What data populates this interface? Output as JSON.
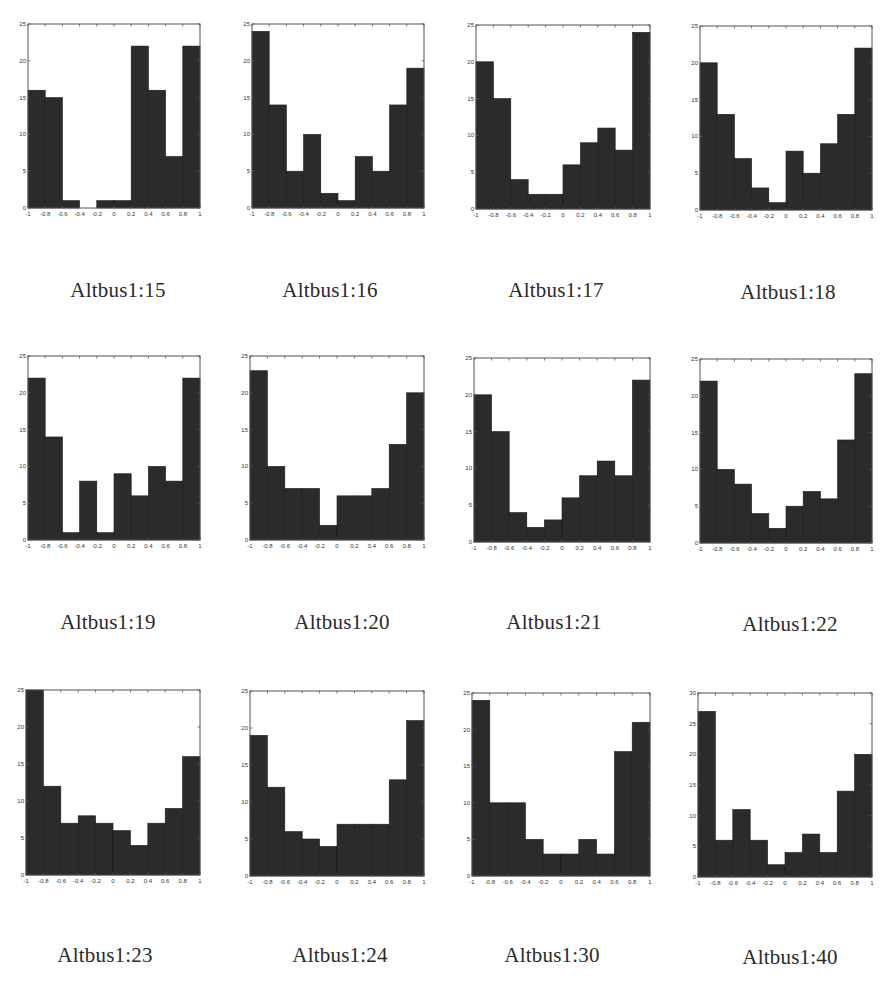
{
  "chart_data": [
    {
      "type": "bar",
      "title": "Altbus1:15",
      "xlabel": "",
      "ylabel": "",
      "xlim": [
        -1,
        1
      ],
      "ylim": [
        0,
        25
      ],
      "xticks": [
        "-1",
        "-0.8",
        "-0.6",
        "-0.4",
        "-0.2",
        "0",
        "0.2",
        "0.4",
        "0.6",
        "0.8",
        "1"
      ],
      "yticks": [
        "0",
        "5",
        "10",
        "15",
        "20",
        "25"
      ],
      "bin_edges": [
        -1,
        -0.8,
        -0.6,
        -0.4,
        -0.2,
        0,
        0.2,
        0.4,
        0.6,
        0.8,
        1
      ],
      "values": [
        16,
        15,
        1,
        0,
        1,
        1,
        22,
        16,
        7,
        22
      ],
      "grid": false
    },
    {
      "type": "bar",
      "title": "Altbus1:16",
      "xlabel": "",
      "ylabel": "",
      "xlim": [
        -1,
        1
      ],
      "ylim": [
        0,
        25
      ],
      "xticks": [
        "-1",
        "-0.8",
        "-0.6",
        "-0.4",
        "-0.2",
        "0",
        "0.2",
        "0.4",
        "0.6",
        "0.8",
        "1"
      ],
      "yticks": [
        "0",
        "5",
        "10",
        "15",
        "20",
        "25"
      ],
      "bin_edges": [
        -1,
        -0.8,
        -0.6,
        -0.4,
        -0.2,
        0,
        0.2,
        0.4,
        0.6,
        0.8,
        1
      ],
      "values": [
        24,
        14,
        5,
        10,
        2,
        1,
        7,
        5,
        14,
        19
      ],
      "grid": false
    },
    {
      "type": "bar",
      "title": "Altbus1:17",
      "xlabel": "",
      "ylabel": "",
      "xlim": [
        -1,
        1
      ],
      "ylim": [
        0,
        25
      ],
      "xticks": [
        "-1",
        "-0.8",
        "-0.6",
        "-0.4",
        "-0.2",
        "0",
        "0.2",
        "0.4",
        "0.6",
        "0.8",
        "1"
      ],
      "yticks": [
        "0",
        "5",
        "10",
        "15",
        "20",
        "25"
      ],
      "bin_edges": [
        -1,
        -0.8,
        -0.6,
        -0.4,
        -0.2,
        0,
        0.2,
        0.4,
        0.6,
        0.8,
        1
      ],
      "values": [
        20,
        15,
        4,
        2,
        2,
        6,
        9,
        11,
        8,
        24
      ],
      "grid": false
    },
    {
      "type": "bar",
      "title": "Altbus1:18",
      "xlabel": "",
      "ylabel": "",
      "xlim": [
        -1,
        1
      ],
      "ylim": [
        0,
        25
      ],
      "xticks": [
        "-1",
        "-0.8",
        "-0.6",
        "-0.4",
        "-0.2",
        "0",
        "0.2",
        "0.4",
        "0.6",
        "0.8",
        "1"
      ],
      "yticks": [
        "0",
        "5",
        "10",
        "15",
        "20",
        "25"
      ],
      "bin_edges": [
        -1,
        -0.8,
        -0.6,
        -0.4,
        -0.2,
        0,
        0.2,
        0.4,
        0.6,
        0.8,
        1
      ],
      "values": [
        20,
        13,
        7,
        3,
        1,
        8,
        5,
        9,
        13,
        22
      ],
      "grid": false
    },
    {
      "type": "bar",
      "title": "Altbus1:19",
      "xlabel": "",
      "ylabel": "",
      "xlim": [
        -1,
        1
      ],
      "ylim": [
        0,
        25
      ],
      "xticks": [
        "-1",
        "-0.8",
        "-0.6",
        "-0.4",
        "-0.2",
        "0",
        "0.2",
        "0.4",
        "0.6",
        "0.8",
        "1"
      ],
      "yticks": [
        "0",
        "5",
        "10",
        "15",
        "20",
        "25"
      ],
      "bin_edges": [
        -1,
        -0.8,
        -0.6,
        -0.4,
        -0.2,
        0,
        0.2,
        0.4,
        0.6,
        0.8,
        1
      ],
      "values": [
        22,
        14,
        1,
        8,
        1,
        9,
        6,
        10,
        8,
        22
      ],
      "grid": false
    },
    {
      "type": "bar",
      "title": "Altbus1:20",
      "xlabel": "",
      "ylabel": "",
      "xlim": [
        -1,
        1
      ],
      "ylim": [
        0,
        25
      ],
      "xticks": [
        "-1",
        "-0.8",
        "-0.6",
        "-0.4",
        "-0.2",
        "0",
        "0.2",
        "0.4",
        "0.6",
        "0.8",
        "1"
      ],
      "yticks": [
        "0",
        "5",
        "10",
        "15",
        "20",
        "25"
      ],
      "bin_edges": [
        -1,
        -0.8,
        -0.6,
        -0.4,
        -0.2,
        0,
        0.2,
        0.4,
        0.6,
        0.8,
        1
      ],
      "values": [
        23,
        10,
        7,
        7,
        2,
        6,
        6,
        7,
        13,
        20
      ],
      "grid": false
    },
    {
      "type": "bar",
      "title": "Altbus1:21",
      "xlabel": "",
      "ylabel": "",
      "xlim": [
        -1,
        1
      ],
      "ylim": [
        0,
        25
      ],
      "xticks": [
        "-1",
        "-0.8",
        "-0.6",
        "-0.4",
        "-0.2",
        "0",
        "0.2",
        "0.4",
        "0.6",
        "0.8",
        "1"
      ],
      "yticks": [
        "0",
        "5",
        "10",
        "15",
        "20",
        "25"
      ],
      "bin_edges": [
        -1,
        -0.8,
        -0.6,
        -0.4,
        -0.2,
        0,
        0.2,
        0.4,
        0.6,
        0.8,
        1
      ],
      "values": [
        20,
        15,
        4,
        2,
        3,
        6,
        9,
        11,
        9,
        22
      ],
      "grid": false
    },
    {
      "type": "bar",
      "title": "Altbus1:22",
      "xlabel": "",
      "ylabel": "",
      "xlim": [
        -1,
        1
      ],
      "ylim": [
        0,
        25
      ],
      "xticks": [
        "-1",
        "-0.8",
        "-0.6",
        "-0.4",
        "-0.2",
        "0",
        "0.2",
        "0.4",
        "0.6",
        "0.8",
        "1"
      ],
      "yticks": [
        "0",
        "5",
        "10",
        "15",
        "20",
        "25"
      ],
      "bin_edges": [
        -1,
        -0.8,
        -0.6,
        -0.4,
        -0.2,
        0,
        0.2,
        0.4,
        0.6,
        0.8,
        1
      ],
      "values": [
        22,
        10,
        8,
        4,
        2,
        5,
        7,
        6,
        14,
        23
      ],
      "grid": false
    },
    {
      "type": "bar",
      "title": "Altbus1:23",
      "xlabel": "",
      "ylabel": "",
      "xlim": [
        -1,
        1
      ],
      "ylim": [
        0,
        25
      ],
      "xticks": [
        "-1",
        "-0.8",
        "-0.6",
        "-0.4",
        "-0.2",
        "0",
        "0.2",
        "0.4",
        "0.6",
        "0.8",
        "1"
      ],
      "yticks": [
        "0",
        "5",
        "10",
        "15",
        "20",
        "25"
      ],
      "bin_edges": [
        -1,
        -0.8,
        -0.6,
        -0.4,
        -0.2,
        0,
        0.2,
        0.4,
        0.6,
        0.8,
        1
      ],
      "values": [
        25,
        12,
        7,
        8,
        7,
        6,
        4,
        7,
        9,
        16
      ],
      "grid": false
    },
    {
      "type": "bar",
      "title": "Altbus1:24",
      "xlabel": "",
      "ylabel": "",
      "xlim": [
        -1,
        1
      ],
      "ylim": [
        0,
        25
      ],
      "xticks": [
        "-1",
        "-0.8",
        "-0.6",
        "-0.4",
        "-0.2",
        "0",
        "0.2",
        "0.4",
        "0.6",
        "0.8",
        "1"
      ],
      "yticks": [
        "0",
        "5",
        "10",
        "15",
        "20",
        "25"
      ],
      "bin_edges": [
        -1,
        -0.8,
        -0.6,
        -0.4,
        -0.2,
        0,
        0.2,
        0.4,
        0.6,
        0.8,
        1
      ],
      "values": [
        19,
        12,
        6,
        5,
        4,
        7,
        7,
        7,
        13,
        21
      ],
      "grid": false
    },
    {
      "type": "bar",
      "title": "Altbus1:30",
      "xlabel": "",
      "ylabel": "",
      "xlim": [
        -1,
        1
      ],
      "ylim": [
        0,
        25
      ],
      "xticks": [
        "-1",
        "-0.8",
        "-0.6",
        "-0.4",
        "-0.2",
        "0",
        "0.2",
        "0.4",
        "0.6",
        "0.8",
        "1"
      ],
      "yticks": [
        "0",
        "5",
        "10",
        "15",
        "20",
        "25"
      ],
      "bin_edges": [
        -1,
        -0.8,
        -0.6,
        -0.4,
        -0.2,
        0,
        0.2,
        0.4,
        0.6,
        0.8,
        1
      ],
      "values": [
        24,
        10,
        10,
        5,
        3,
        3,
        5,
        3,
        17,
        21
      ],
      "grid": false
    },
    {
      "type": "bar",
      "title": "Altbus1:40",
      "xlabel": "",
      "ylabel": "",
      "xlim": [
        -1,
        1
      ],
      "ylim": [
        0,
        30
      ],
      "xticks": [
        "-1",
        "-0.8",
        "-0.6",
        "-0.4",
        "-0.2",
        "0",
        "0.2",
        "0.4",
        "0.6",
        "0.8",
        "1"
      ],
      "yticks": [
        "0",
        "5",
        "10",
        "15",
        "20",
        "25",
        "30"
      ],
      "bin_edges": [
        -1,
        -0.8,
        -0.6,
        -0.4,
        -0.2,
        0,
        0.2,
        0.4,
        0.6,
        0.8,
        1
      ],
      "values": [
        27,
        6,
        11,
        6,
        2,
        4,
        7,
        4,
        14,
        20
      ],
      "grid": false
    }
  ],
  "captions": [
    "Altbus1:15",
    "Altbus1:16",
    "Altbus1:17",
    "Altbus1:18",
    "Altbus1:19",
    "Altbus1:20",
    "Altbus1:21",
    "Altbus1:22",
    "Altbus1:23",
    "Altbus1:24",
    "Altbus1:30",
    "Altbus1:40"
  ],
  "colors": {
    "bar_fill": "#2b2b2b",
    "axis": "#555555",
    "background": "#ffffff",
    "caption": "#2a2a2a"
  }
}
